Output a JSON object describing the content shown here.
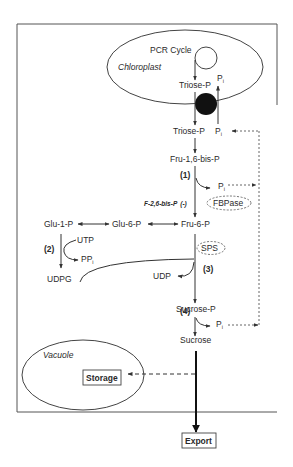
{
  "diagram": {
    "type": "metabolic-pathway",
    "compartments": {
      "chloroplast": "Chloroplast",
      "vacuole": "Vacuole"
    },
    "nodes": {
      "pcr_cycle": "PCR Cycle",
      "triose_p_inside": "Triose-P",
      "pi_inside": "P",
      "triose_p_cytosol": "Triose-P",
      "pi_cytosol": "P",
      "fru_16_bisp": "Fru-1,6-bis-P",
      "pi_step1": "P",
      "fru_6_p": "Fru-6-P",
      "glu_6_p": "Glu-6-P",
      "glu_1_p": "Glu-1-P",
      "utp": "UTP",
      "ppi": "PP",
      "udpg": "UDPG",
      "udp": "UDP",
      "sucrose_p": "Sucrose-P",
      "pi_step4": "P",
      "sucrose": "Sucrose",
      "storage": "Storage",
      "export": "Export"
    },
    "subscript_i": "i",
    "steps": {
      "step1": "(1)",
      "step2": "(2)",
      "step3": "(3)",
      "step4": "(4)"
    },
    "enzymes": {
      "fbpase": "FBPase",
      "sps": "SPS"
    },
    "regulators": {
      "f26bp": "F-2,6-bis-P",
      "f26bp_effect": "(-)"
    },
    "colors": {
      "line": "#333333",
      "translocator": "#111111",
      "dashed": "#555555",
      "background": "#ffffff"
    }
  }
}
